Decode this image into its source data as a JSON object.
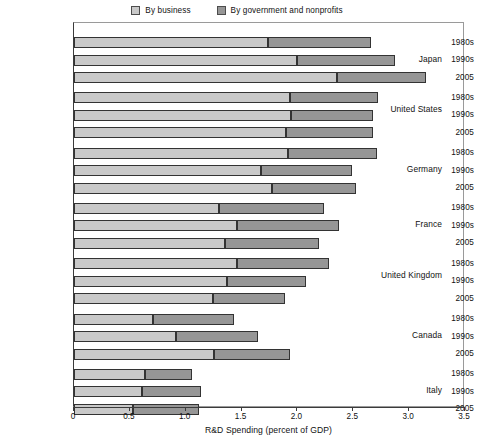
{
  "legend": {
    "items": [
      {
        "label": "By business",
        "color": "#c9c9c9",
        "key": "business"
      },
      {
        "label": "By government and nonprofits",
        "color": "#969696",
        "key": "government"
      }
    ]
  },
  "axis": {
    "x_title": "R&D Spending (percent of GDP)",
    "ticks": [
      "0",
      "0.5",
      "1.0",
      "1.5",
      "2.0",
      "2.5",
      "3.0",
      "3.5"
    ],
    "min": 0,
    "max": 3.5
  },
  "chart_data": {
    "type": "bar",
    "orientation": "horizontal",
    "stacked": true,
    "title": "",
    "subtitle": "",
    "xlabel": "R&D Spending (percent of GDP)",
    "ylabel": "",
    "xlim": [
      0,
      3.5
    ],
    "xticks": [
      0,
      0.5,
      1.0,
      1.5,
      2.0,
      2.5,
      3.0,
      3.5
    ],
    "grid": false,
    "legend_position": "top-center",
    "series": [
      {
        "name": "By business",
        "color": "#c9c9c9"
      },
      {
        "name": "By government and nonprofits",
        "color": "#969696"
      }
    ],
    "groups": [
      {
        "country": "Japan",
        "rows": [
          {
            "period": "1980s",
            "business": 1.74,
            "government": 0.92,
            "total": 2.66
          },
          {
            "period": "1990s",
            "business": 2.0,
            "government": 0.87,
            "total": 2.87
          },
          {
            "period": "2005",
            "business": 2.35,
            "government": 0.8,
            "total": 3.15
          }
        ]
      },
      {
        "country": "United States",
        "rows": [
          {
            "period": "1980s",
            "business": 1.93,
            "government": 0.79,
            "total": 2.72
          },
          {
            "period": "1990s",
            "business": 1.94,
            "government": 0.74,
            "total": 2.68
          },
          {
            "period": "2005",
            "business": 1.9,
            "government": 0.78,
            "total": 2.68
          }
        ]
      },
      {
        "country": "Germany",
        "rows": [
          {
            "period": "1980s",
            "business": 1.92,
            "government": 0.79,
            "total": 2.71
          },
          {
            "period": "1990s",
            "business": 1.67,
            "government": 0.82,
            "total": 2.49
          },
          {
            "period": "2005",
            "business": 1.77,
            "government": 0.75,
            "total": 2.52
          }
        ]
      },
      {
        "country": "France",
        "rows": [
          {
            "period": "1980s",
            "business": 1.3,
            "government": 0.94,
            "total": 2.24
          },
          {
            "period": "1990s",
            "business": 1.46,
            "government": 0.91,
            "total": 2.37
          },
          {
            "period": "2005",
            "business": 1.35,
            "government": 0.84,
            "total": 2.19
          }
        ]
      },
      {
        "country": "United Kingdom",
        "rows": [
          {
            "period": "1980s",
            "business": 1.46,
            "government": 0.82,
            "total": 2.28
          },
          {
            "period": "1990s",
            "business": 1.37,
            "government": 0.71,
            "total": 2.08
          },
          {
            "period": "2005",
            "business": 1.24,
            "government": 0.65,
            "total": 1.89
          }
        ]
      },
      {
        "country": "Canada",
        "rows": [
          {
            "period": "1980s",
            "business": 0.71,
            "government": 0.72,
            "total": 1.43
          },
          {
            "period": "1990s",
            "business": 0.91,
            "government": 0.74,
            "total": 1.65
          },
          {
            "period": "2005",
            "business": 1.25,
            "government": 0.68,
            "total": 1.93
          }
        ]
      },
      {
        "country": "Italy",
        "rows": [
          {
            "period": "1980s",
            "business": 0.64,
            "government": 0.42,
            "total": 1.06
          },
          {
            "period": "1990s",
            "business": 0.61,
            "government": 0.53,
            "total": 1.14
          },
          {
            "period": "2005",
            "business": 0.53,
            "government": 0.59,
            "total": 1.12
          }
        ]
      }
    ]
  }
}
